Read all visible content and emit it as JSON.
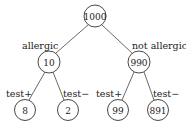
{
  "diagram": {
    "type": "tree",
    "nodes": [
      {
        "id": "root",
        "value": "1000",
        "cx": 95,
        "cy": 16
      },
      {
        "id": "allergic",
        "value": "10",
        "cx": 49,
        "cy": 62
      },
      {
        "id": "not_allergic",
        "value": "990",
        "cx": 139,
        "cy": 62
      },
      {
        "id": "allergic_pos",
        "value": "8",
        "cx": 25,
        "cy": 110
      },
      {
        "id": "allergic_neg",
        "value": "2",
        "cx": 68,
        "cy": 110
      },
      {
        "id": "not_allergic_pos",
        "value": "99",
        "cx": 118,
        "cy": 110
      },
      {
        "id": "not_allergic_neg",
        "value": "891",
        "cx": 158,
        "cy": 110
      }
    ],
    "labels": {
      "allergic": "allergic",
      "not_allergic": "not allergic",
      "test_pos_left": "test+",
      "test_neg_left": "test−",
      "test_pos_right": "test+",
      "test_neg_right": "test−"
    }
  }
}
